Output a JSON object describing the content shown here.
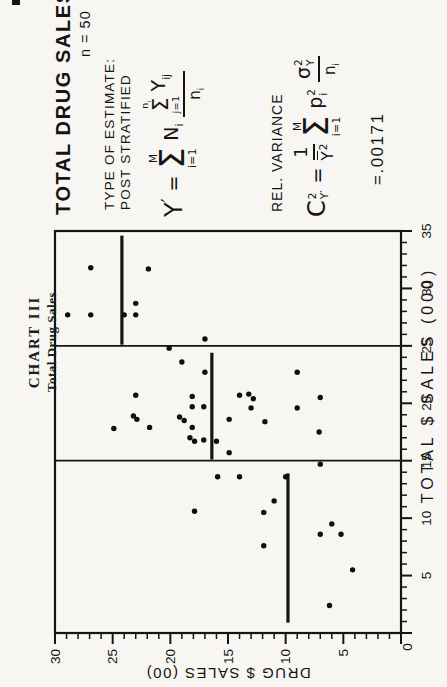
{
  "page": {
    "background": "#f7f6f2",
    "ink": "#141414"
  },
  "chart_header": {
    "line1": "CHART III",
    "line2": "Total Drug Sales"
  },
  "stats_panel": {
    "title": "TOTAL DRUG SALES",
    "sample_size": "n = 50",
    "estimate_label_line1": "TYPE OF ESTIMATE:",
    "estimate_label_line2": "POST STRATIFIED",
    "rel_variance_label": "REL. VARIANCE",
    "rel_variance_result": "=.00171",
    "estimate_formula": {
      "lhs_base": "Y",
      "lhs_prime": "′",
      "equals": "=",
      "sum_upper": "M",
      "sum_sigma": "Σ",
      "sum_lower": "i=1",
      "weight_base": "N",
      "weight_sub": "i",
      "inner_sum_upper_base": "n",
      "inner_sum_upper_sub": "i",
      "inner_sum_sigma": "Σ",
      "inner_sum_lower": "j=1",
      "numerator_base": "Y",
      "numerator_sub": "ij",
      "denominator_base": "n",
      "denominator_sub": "i"
    },
    "variance_formula": {
      "lhs_base": "C",
      "lhs_sup": "2",
      "lhs_sub": "Y′",
      "equals": "=",
      "frac1_numerator": "1",
      "frac1_den_base": "Y",
      "frac1_den_sup": "2",
      "sum_upper": "M",
      "sum_sigma": "Σ",
      "sum_lower": "i=1",
      "p_base": "p",
      "p_sup": "2",
      "p_sub": "i",
      "frac2_num_base": "σ",
      "frac2_num_sup": "2",
      "frac2_num_sub": "Y",
      "frac2_den_base": "n",
      "frac2_den_sub": "i"
    }
  },
  "chart_data": {
    "type": "scatter",
    "title": "TOTAL DRUG SALES",
    "xlabel": "TOTAL $ SALES (000)",
    "ylabel": "DRUG $ SALES (00)",
    "xlim": [
      0,
      35
    ],
    "ylim": [
      0,
      30
    ],
    "x_major_ticks": [
      5,
      10,
      15,
      20,
      25,
      30,
      35
    ],
    "y_major_ticks": [
      5,
      10,
      15,
      20,
      25,
      30
    ],
    "origin_tick_label": "0",
    "minor_tick_step": 1,
    "major_tick_every": 5,
    "grid": false,
    "n_points": 50,
    "stratum_boundaries_x": [
      15,
      25
    ],
    "stratum_mean_lines": [
      {
        "drug_mean": 9.8,
        "x_from": 0.9,
        "x_to": 13.9
      },
      {
        "drug_mean": 16.4,
        "x_from": 15.1,
        "x_to": 24.4
      },
      {
        "drug_mean": 24.2,
        "x_from": 25.1,
        "x_to": 34.6
      }
    ],
    "points": [
      [
        2.4,
        6.2
      ],
      [
        5.5,
        4.2
      ],
      [
        7.6,
        11.9
      ],
      [
        8.6,
        7.0
      ],
      [
        8.6,
        5.2
      ],
      [
        9.5,
        6.0
      ],
      [
        10.5,
        11.9
      ],
      [
        10.6,
        17.9
      ],
      [
        11.5,
        11.0
      ],
      [
        13.6,
        10.0
      ],
      [
        13.6,
        14.0
      ],
      [
        13.6,
        15.9
      ],
      [
        14.7,
        7.0
      ],
      [
        15.7,
        14.9
      ],
      [
        16.7,
        16.0
      ],
      [
        16.8,
        17.1
      ],
      [
        16.7,
        17.9
      ],
      [
        17.0,
        18.3
      ],
      [
        17.5,
        7.1
      ],
      [
        17.9,
        18.1
      ],
      [
        17.9,
        21.8
      ],
      [
        17.8,
        24.9
      ],
      [
        18.4,
        11.8
      ],
      [
        18.6,
        14.9
      ],
      [
        18.5,
        18.8
      ],
      [
        18.8,
        19.2
      ],
      [
        18.6,
        22.9
      ],
      [
        18.9,
        23.2
      ],
      [
        19.6,
        9.0
      ],
      [
        19.6,
        13.0
      ],
      [
        19.7,
        17.1
      ],
      [
        19.7,
        18.1
      ],
      [
        20.4,
        12.8
      ],
      [
        20.8,
        13.2
      ],
      [
        20.7,
        14.0
      ],
      [
        20.5,
        7.0
      ],
      [
        20.6,
        18.1
      ],
      [
        20.7,
        23.0
      ],
      [
        22.7,
        9.0
      ],
      [
        22.7,
        17.0
      ],
      [
        23.6,
        19.0
      ],
      [
        24.8,
        20.1
      ],
      [
        25.6,
        17.0
      ],
      [
        27.7,
        23.0
      ],
      [
        27.7,
        24.0
      ],
      [
        27.7,
        26.9
      ],
      [
        27.7,
        28.9
      ],
      [
        28.7,
        23.0
      ],
      [
        31.7,
        21.9
      ],
      [
        31.8,
        26.9
      ]
    ]
  }
}
